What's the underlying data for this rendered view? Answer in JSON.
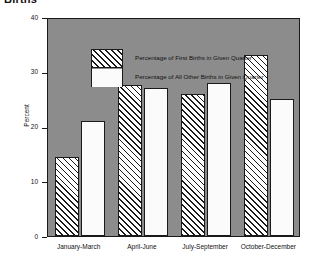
{
  "title": "Births",
  "chart_data": {
    "type": "bar",
    "title": "Births",
    "xlabel": "",
    "ylabel": "Percent",
    "ylim": [
      0,
      40
    ],
    "yticks": [
      0,
      10,
      20,
      30,
      40
    ],
    "ytick_labels": [
      "0",
      "10",
      "20",
      "30",
      "40"
    ],
    "grid": false,
    "legend_position": "upper-left-inside",
    "categories": [
      "January-March",
      "April-June",
      "July-September",
      "October-December"
    ],
    "series": [
      {
        "name": "Percentage of First Births in Given Quarter",
        "pattern": "diagonal-hatch",
        "values": [
          14.5,
          27.5,
          26.0,
          33.0
        ]
      },
      {
        "name": "Percentage of All Other Births in Given Quarter",
        "pattern": "solid-white",
        "values": [
          21.0,
          27.0,
          28.0,
          25.0
        ]
      }
    ],
    "colors": {
      "plot_background": "#8c8c8c",
      "page_background": "#ffffff",
      "axis": "#1a1a1a",
      "text": "#111111",
      "bar_fill": "#ffffff"
    }
  }
}
